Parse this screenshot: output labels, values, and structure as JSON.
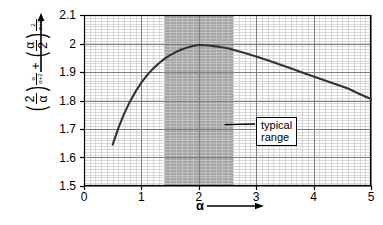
{
  "chart_data": {
    "type": "line",
    "title": "",
    "xlabel": "α",
    "ylabel": "(2/α)^(α/(α+2)) + (α/2)^(2/(α+2))",
    "xlim": [
      0,
      5
    ],
    "ylim": [
      1.5,
      2.1
    ],
    "grid": true,
    "legend": null,
    "xticks": [
      "0",
      "1",
      "2",
      "3",
      "4",
      "5"
    ],
    "xtick_values": [
      0,
      1,
      2,
      3,
      4,
      5
    ],
    "yticks": [
      "1.5",
      "1.6",
      "1.7",
      "1.8",
      "1.9",
      "2",
      "2.1"
    ],
    "ytick_values": [
      1.5,
      1.6,
      1.7,
      1.8,
      1.9,
      2.0,
      2.1
    ],
    "x": [
      0.5,
      0.6,
      0.7,
      0.8,
      0.9,
      1.0,
      1.1,
      1.2,
      1.3,
      1.4,
      1.5,
      1.6,
      1.7,
      1.8,
      1.9,
      2.0,
      2.1,
      2.2,
      2.3,
      2.4,
      2.5,
      2.6,
      2.8,
      3.0,
      3.2,
      3.4,
      3.6,
      3.8,
      4.0,
      4.2,
      4.4,
      4.6,
      4.8,
      5.0
    ],
    "y": [
      1.645,
      1.704,
      1.754,
      1.796,
      1.832,
      1.863,
      1.889,
      1.911,
      1.93,
      1.946,
      1.959,
      1.97,
      1.979,
      1.986,
      1.991,
      1.995,
      1.994,
      1.992,
      1.99,
      1.987,
      1.983,
      1.978,
      1.967,
      1.954,
      1.941,
      1.927,
      1.913,
      1.898,
      1.884,
      1.87,
      1.856,
      1.842,
      1.823,
      1.805
    ],
    "series": [
      {
        "name": "(2/α)^(α/(α+2)) + (α/2)^(2/(α+2))",
        "color": "#333333"
      }
    ],
    "shaded_region": {
      "label": "typical range",
      "x_start": 1.4,
      "x_end": 2.6,
      "color": "#a6a6a6"
    },
    "annotations": [
      {
        "text_line1": "typical",
        "text_line2": "range",
        "points_to_x": 2.45,
        "points_to_y": 1.715
      }
    ],
    "peak": {
      "x": 2.0,
      "y": 1.995
    }
  },
  "axis_labels": {
    "x_symbol": "α",
    "x_arrow": "⟶",
    "y_numerator_1": "2",
    "y_denominator_1": "α",
    "y_exp_num_1": "α",
    "y_exp_den_1": "α+2",
    "plus": "+",
    "y_numerator_2": "α",
    "y_denominator_2": "2",
    "y_exp_num_2": "2",
    "y_exp_den_2": "α+2",
    "paren_open": "(",
    "paren_close": ")"
  },
  "colors": {
    "curve": "#333333",
    "shaded_band": "#a6a6a6",
    "major_grid": "#808080",
    "minor_grid": "#c8c8c8",
    "axis": "#000000",
    "background": "#ffffff"
  }
}
